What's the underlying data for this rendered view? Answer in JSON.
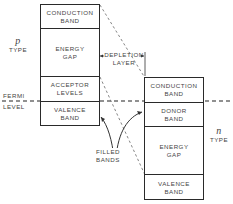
{
  "diagram": {
    "p_side": {
      "symbol": "p",
      "label": "TYPE",
      "bands": [
        {
          "line1": "CONDUCTION",
          "line2": "BAND"
        },
        {
          "line1": "ENERGY",
          "line2": "GAP"
        },
        {
          "line1": "ACCEPTOR",
          "line2": "LEVELS"
        },
        {
          "line1": "VALENCE",
          "line2": "BAND"
        }
      ]
    },
    "n_side": {
      "symbol": "n",
      "label": "TYPE",
      "bands": [
        {
          "line1": "CONDUCTION",
          "line2": "BAND"
        },
        {
          "line1": "DONOR",
          "line2": "BAND"
        },
        {
          "line1": "ENERGY",
          "line2": "GAP"
        },
        {
          "line1": "VALENCE",
          "line2": "BAND"
        }
      ]
    },
    "depletion_layer": {
      "line1": "DEPLETION",
      "line2": "LAYER"
    },
    "fermi_level": {
      "line1": "FERMI",
      "line2": "LEVEL"
    },
    "filled_bands": {
      "line1": "FILLED",
      "line2": "BANDS"
    }
  }
}
